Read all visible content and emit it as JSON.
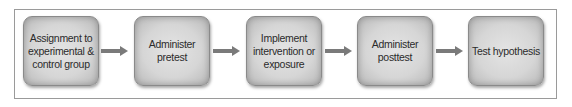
{
  "diagram": {
    "type": "flowchart",
    "direction": "left-to-right",
    "steps": [
      {
        "label": "Assignment to experimental & control group"
      },
      {
        "label": "Administer pretest"
      },
      {
        "label": "Implement intervention or exposure"
      },
      {
        "label": "Administer posttest"
      },
      {
        "label": "Test hypothesis"
      }
    ],
    "colors": {
      "box_fill": "#d6d6d6",
      "arrow": "#7a7a7a",
      "frame": "#9a9a9a",
      "text": "#2b2b2b"
    }
  }
}
